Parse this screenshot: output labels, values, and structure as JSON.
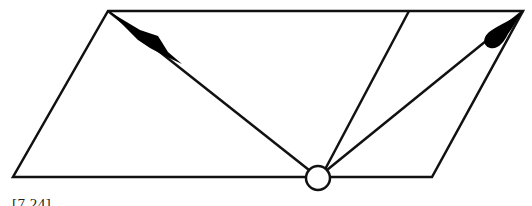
{
  "figure": {
    "caption_fragment": "[7.24]",
    "stroke_color": "#111111",
    "fill_color": "#000000",
    "background": "#ffffff",
    "parallelogram": {
      "top_left": [
        108,
        11
      ],
      "top_right": [
        523,
        11
      ],
      "bottom_right": [
        432,
        177
      ],
      "bottom_left": [
        13,
        177
      ]
    },
    "divider_line": {
      "from": [
        409,
        11
      ],
      "to": [
        321,
        177
      ]
    },
    "pivot_circle": {
      "cx": 318,
      "cy": 178,
      "r": 12
    },
    "rays": [
      {
        "name": "left-ray",
        "from": [
          318,
          178
        ],
        "to": [
          108,
          11
        ]
      },
      {
        "name": "right-ray",
        "from": [
          318,
          178
        ],
        "to": [
          523,
          11
        ]
      }
    ]
  }
}
